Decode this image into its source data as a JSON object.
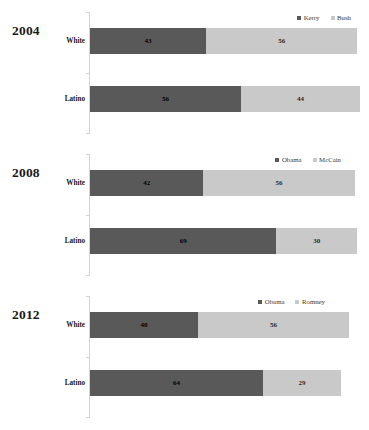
{
  "chart_data": [
    {
      "type": "bar",
      "title": "2004",
      "orientation": "horizontal",
      "stacked": true,
      "xlabel": "",
      "ylabel": "",
      "xlim": [
        0,
        100
      ],
      "grid": false,
      "legend_position": "top-right",
      "categories": [
        "White",
        "Latino"
      ],
      "series": [
        {
          "name": "Kerry",
          "color": "#595959",
          "values": [
            43,
            56
          ]
        },
        {
          "name": "Bush",
          "color": "#c9c9c9",
          "values": [
            56,
            44
          ]
        }
      ]
    },
    {
      "type": "bar",
      "title": "2008",
      "orientation": "horizontal",
      "stacked": true,
      "xlabel": "",
      "ylabel": "",
      "xlim": [
        0,
        100
      ],
      "grid": false,
      "legend_position": "top-right",
      "categories": [
        "White",
        "Latino"
      ],
      "series": [
        {
          "name": "Obama",
          "color": "#595959",
          "values": [
            42,
            69
          ]
        },
        {
          "name": "McCain",
          "color": "#c9c9c9",
          "values": [
            56,
            30
          ]
        }
      ]
    },
    {
      "type": "bar",
      "title": "2012",
      "orientation": "horizontal",
      "stacked": true,
      "xlabel": "",
      "ylabel": "",
      "xlim": [
        0,
        100
      ],
      "grid": false,
      "legend_position": "top-right",
      "categories": [
        "White",
        "Latino"
      ],
      "series": [
        {
          "name": "Obama",
          "color": "#595959",
          "values": [
            40,
            64
          ]
        },
        {
          "name": "Romney",
          "color": "#c9c9c9",
          "values": [
            56,
            29
          ]
        }
      ]
    }
  ]
}
